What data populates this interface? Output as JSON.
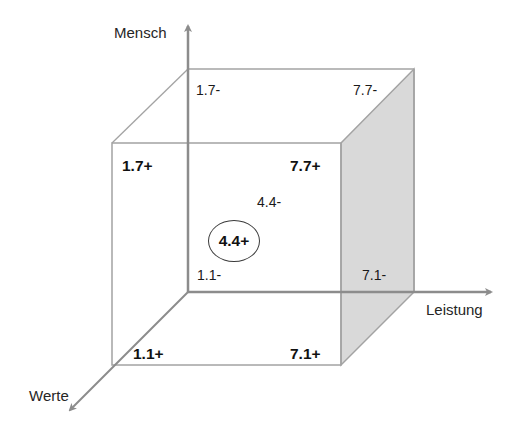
{
  "diagram": {
    "type": "3d-cube-coordinate-model",
    "colors": {
      "axis": "#8c8c8c",
      "edge": "#a3a3a3",
      "shaded_face": "#d9d9d9",
      "text": "#1a1a1a"
    },
    "axes": {
      "vertical": {
        "label": "Mensch"
      },
      "horizontal": {
        "label": "Leistung"
      },
      "depth": {
        "label": "Werte"
      }
    },
    "back_face_labels": {
      "top_left": "1.7-",
      "top_right": "7.7-",
      "center": "4.4-",
      "bottom_left": "1.1-",
      "bottom_right": "7.1-"
    },
    "front_face_labels": {
      "top_left": "1.7+",
      "top_right": "7.7+",
      "bottom_left": "1.1+",
      "bottom_right": "7.1+"
    },
    "highlighted": {
      "label": "4.4+"
    }
  }
}
